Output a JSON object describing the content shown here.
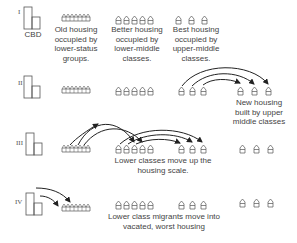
{
  "diagram": {
    "stages": [
      {
        "id": "I",
        "label": "I",
        "cbd_label": "CBD"
      },
      {
        "id": "II",
        "label": "II"
      },
      {
        "id": "III",
        "label": "III"
      },
      {
        "id": "IV",
        "label": "IV"
      }
    ],
    "column_labels": {
      "old_housing": "Old housing occupied by lower-status groups.",
      "old_housing_lines": [
        "Old housing",
        "occupied by",
        "lower-status",
        "groups."
      ],
      "better_housing_lines": [
        "Better housing",
        "occupied by",
        "lower-middle",
        "classes."
      ],
      "best_housing_lines": [
        "Best housing",
        "occupied by",
        "upper-middle",
        "classes."
      ]
    },
    "annotations": {
      "new_housing_lines": [
        "New housing",
        "built by upper",
        "middle classes"
      ],
      "lower_classes_move_lines": [
        "Lower classes move up the",
        "housing scale."
      ],
      "migrants_lines": [
        "Lower class migrants move into",
        "vacated, worst housing"
      ]
    },
    "colors": {
      "line": "#444444",
      "text": "#444444",
      "background": "#ffffff"
    }
  }
}
